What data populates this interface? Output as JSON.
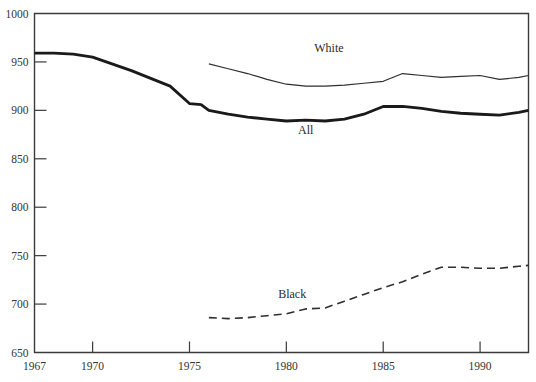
{
  "chart_data": {
    "type": "line",
    "title": "",
    "subtitle": "",
    "xlabel": "",
    "ylabel": "",
    "xlim": [
      1967,
      1992.5
    ],
    "ylim": [
      650,
      1000
    ],
    "grid": false,
    "legend_position": "inline-labels",
    "y_ticks": [
      650,
      700,
      750,
      800,
      850,
      900,
      950,
      1000
    ],
    "x_ticks": [
      1967,
      1970,
      1975,
      1980,
      1985,
      1990
    ],
    "x_tick_labels": [
      "1967",
      "1970",
      "1975",
      "1980",
      "1985",
      "1990"
    ],
    "y_tick_labels": [
      "650",
      "700",
      "750",
      "800",
      "850",
      "900",
      "950",
      "1000"
    ],
    "series": [
      {
        "name": "White",
        "label": "White",
        "style": "solid",
        "stroke_width": 1.2,
        "color": "#2f2f2f",
        "label_x": 1982.2,
        "label_y": 960,
        "x": [
          1976.0,
          1977.0,
          1978.0,
          1979.0,
          1980.0,
          1981.0,
          1982.0,
          1983.0,
          1984.0,
          1985.0,
          1986.0,
          1987.0,
          1988.0,
          1989.0,
          1990.0,
          1991.0,
          1992.0,
          1992.5
        ],
        "values": [
          948,
          943,
          938,
          932,
          927,
          925,
          925,
          926,
          928,
          930,
          938,
          936,
          934,
          935,
          936,
          932,
          934,
          936
        ]
      },
      {
        "name": "All",
        "label": "All",
        "style": "solid",
        "stroke_width": 2.8,
        "color": "#1a1a1a",
        "label_x": 1981.0,
        "label_y": 876,
        "x": [
          1967.0,
          1968.0,
          1969.0,
          1970.0,
          1971.0,
          1972.0,
          1973.0,
          1974.0,
          1975.0,
          1975.6,
          1976.0,
          1977.0,
          1978.0,
          1979.0,
          1980.0,
          1981.0,
          1982.0,
          1983.0,
          1984.0,
          1985.0,
          1986.0,
          1987.0,
          1988.0,
          1989.0,
          1990.0,
          1991.0,
          1992.0,
          1992.5
        ],
        "values": [
          959,
          959,
          958,
          955,
          948,
          941,
          933,
          925,
          907,
          906,
          900,
          896,
          893,
          891,
          889,
          890,
          889,
          891,
          896,
          904,
          904,
          902,
          899,
          897,
          896,
          895,
          898,
          900
        ]
      },
      {
        "name": "Black",
        "label": "Black",
        "style": "dashed",
        "stroke_width": 1.6,
        "dash": "8,5",
        "color": "#2f2f2f",
        "label_x": 1980.3,
        "label_y": 706,
        "x": [
          1976.0,
          1977.0,
          1978.0,
          1979.0,
          1980.0,
          1981.0,
          1982.0,
          1983.0,
          1984.0,
          1985.0,
          1986.0,
          1987.0,
          1988.0,
          1989.0,
          1990.0,
          1991.0,
          1992.0,
          1992.5
        ],
        "values": [
          686,
          685,
          686,
          688,
          690,
          695,
          696,
          703,
          710,
          717,
          723,
          731,
          738,
          738,
          737,
          737,
          739,
          740
        ]
      }
    ]
  }
}
